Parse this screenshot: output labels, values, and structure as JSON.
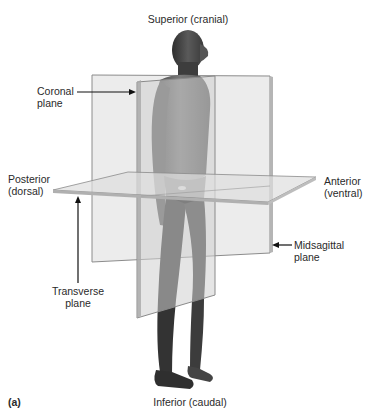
{
  "figure": {
    "panel_label": "(a)",
    "directions": {
      "superior": "Superior (cranial)",
      "inferior": "Inferior (caudal)",
      "posterior_line1": "Posterior",
      "posterior_line2": "(dorsal)",
      "anterior_line1": "Anterior",
      "anterior_line2": "(ventral)"
    },
    "planes": {
      "coronal_line1": "Coronal",
      "coronal_line2": "plane",
      "midsagittal_line1": "Midsagittal",
      "midsagittal_line2": "plane",
      "transverse_line1": "Transverse",
      "transverse_line2": "plane"
    }
  },
  "colors": {
    "background": "#ffffff",
    "plane_fill": "#d9d9d9",
    "plane_edge": "#8a8a8a",
    "skin_dark": "#3a3a3a",
    "label_text": "#2a2a2a"
  }
}
